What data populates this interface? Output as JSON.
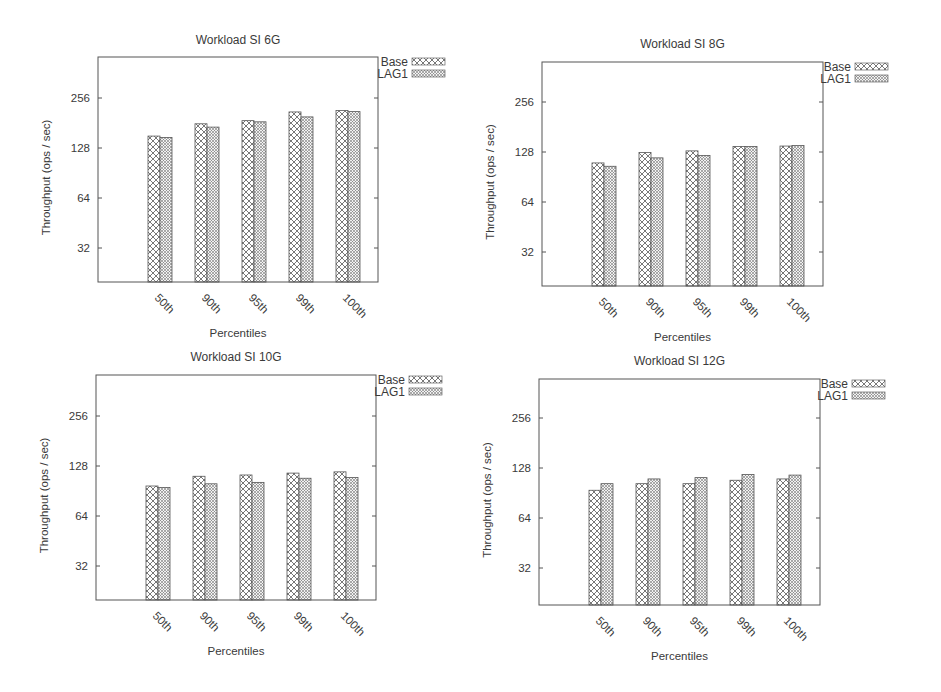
{
  "figure": {
    "legend": [
      {
        "name": "Base",
        "pattern": "crosshatch-light"
      },
      {
        "name": "LAG1",
        "pattern": "crosshatch-dense"
      }
    ],
    "xlabel": "Percentiles",
    "ylabel": "Throughput (ops / sec)",
    "yticks": [
      "32",
      "64",
      "128",
      "256"
    ]
  },
  "chart_data": [
    {
      "type": "bar",
      "title": "Workload SI 6G",
      "xlabel": "Percentiles",
      "ylabel": "Throughput (ops / sec)",
      "yscale": "log2",
      "ylim": [
        16,
        400
      ],
      "yticks": [
        32,
        64,
        128,
        256
      ],
      "grid": false,
      "legend_position": "outside-top-right",
      "categories": [
        "50th",
        "90th",
        "95th",
        "99th",
        "100th"
      ],
      "series": [
        {
          "name": "Base",
          "values": [
            151,
            179,
            187,
            211,
            215
          ]
        },
        {
          "name": "LAG1",
          "values": [
            148,
            171,
            184,
            197,
            212
          ]
        }
      ]
    },
    {
      "type": "bar",
      "title": "Workload SI 8G",
      "xlabel": "Percentiles",
      "ylabel": "Throughput (ops / sec)",
      "yscale": "log2",
      "ylim": [
        16,
        400
      ],
      "yticks": [
        32,
        64,
        128,
        256
      ],
      "grid": false,
      "legend_position": "outside-top-right",
      "categories": [
        "50th",
        "90th",
        "95th",
        "99th",
        "100th"
      ],
      "series": [
        {
          "name": "Base",
          "values": [
            110,
            127,
            130,
            138,
            139
          ]
        },
        {
          "name": "LAG1",
          "values": [
            105,
            118,
            122,
            138,
            140
          ]
        }
      ]
    },
    {
      "type": "bar",
      "title": "Workload SI 10G",
      "xlabel": "Percentiles",
      "ylabel": "Throughput (ops / sec)",
      "yscale": "log2",
      "ylim": [
        16,
        400
      ],
      "yticks": [
        32,
        64,
        128,
        256
      ],
      "grid": false,
      "legend_position": "outside-top-right",
      "categories": [
        "50th",
        "90th",
        "95th",
        "99th",
        "100th"
      ],
      "series": [
        {
          "name": "Base",
          "values": [
            97,
            111,
            113,
            116,
            118
          ]
        },
        {
          "name": "LAG1",
          "values": [
            95,
            100,
            102,
            108,
            109
          ]
        }
      ]
    },
    {
      "type": "bar",
      "title": "Workload SI 12G",
      "xlabel": "Percentiles",
      "ylabel": "Throughput (ops / sec)",
      "yscale": "log2",
      "ylim": [
        16,
        400
      ],
      "yticks": [
        32,
        64,
        128,
        256
      ],
      "grid": false,
      "legend_position": "outside-top-right",
      "categories": [
        "50th",
        "90th",
        "95th",
        "99th",
        "100th"
      ],
      "series": [
        {
          "name": "Base",
          "values": [
            94,
            103,
            103,
            108,
            110
          ]
        },
        {
          "name": "LAG1",
          "values": [
            103,
            110,
            112,
            117,
            116
          ]
        }
      ]
    }
  ],
  "layout": {
    "panels": [
      {
        "frame": {
          "left": 98,
          "top": 57,
          "right": 378,
          "bottom": 282
        },
        "tick256_y": 98,
        "title_y": 44,
        "legend_x": 408,
        "legend_y": 62
      },
      {
        "frame": {
          "left": 542,
          "top": 62,
          "right": 823,
          "bottom": 286
        },
        "tick256_y": 102,
        "title_y": 48,
        "legend_x": 851,
        "legend_y": 67
      },
      {
        "frame": {
          "left": 96,
          "top": 375,
          "right": 376,
          "bottom": 600
        },
        "tick256_y": 416,
        "title_y": 361,
        "legend_x": 405,
        "legend_y": 380
      },
      {
        "frame": {
          "left": 539,
          "top": 379,
          "right": 820,
          "bottom": 605
        },
        "tick256_y": 418,
        "title_y": 365,
        "legend_x": 848,
        "legend_y": 384
      }
    ],
    "px_per_doubling": 50,
    "bar_width": 12,
    "group_first_offset": 50,
    "group_spacing": 47
  }
}
